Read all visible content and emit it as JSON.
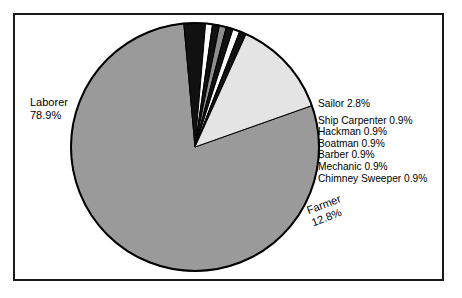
{
  "chart_data": {
    "type": "pie",
    "title": "",
    "subtitle": "",
    "xlabel": "",
    "ylabel": "",
    "legend_position": "callout-labels",
    "grid": false,
    "start_angle_deg": -19.5,
    "direction": "clockwise",
    "categories": [
      "Laborer",
      "Sailor",
      "Ship Carpenter",
      "Hackman",
      "Boatman",
      "Barber",
      "Mechanic",
      "Chimney Sweeper",
      "Farmer"
    ],
    "values": [
      78.9,
      2.8,
      0.9,
      0.9,
      0.9,
      0.9,
      0.9,
      0.9,
      12.8
    ],
    "unit": "%",
    "slices": [
      {
        "label": "Laborer",
        "value": 78.9,
        "display": "78.9%",
        "color": "#9a9a9a",
        "label_position": "outside-left"
      },
      {
        "label": "Sailor",
        "value": 2.8,
        "display": "2.8%",
        "color": "#111111",
        "label_position": "outside-right"
      },
      {
        "label": "Ship Carpenter",
        "value": 0.9,
        "display": "0.9%",
        "color": "#ffffff",
        "label_position": "outside-right"
      },
      {
        "label": "Hackman",
        "value": 0.9,
        "display": "0.9%",
        "color": "#111111",
        "label_position": "outside-right"
      },
      {
        "label": "Boatman",
        "value": 0.9,
        "display": "0.9%",
        "color": "#8e8e8e",
        "label_position": "outside-right"
      },
      {
        "label": "Barber",
        "value": 0.9,
        "display": "0.9%",
        "color": "#111111",
        "label_position": "outside-right"
      },
      {
        "label": "Mechanic",
        "value": 0.9,
        "display": "0.9%",
        "color": "#ffffff",
        "label_position": "outside-right"
      },
      {
        "label": "Chimney Sweeper",
        "value": 0.9,
        "display": "0.9%",
        "color": "#111111",
        "label_position": "outside-right"
      },
      {
        "label": "Farmer",
        "value": 12.8,
        "display": "12.8%",
        "color": "#e4e4e4",
        "label_position": "outside-right-rotated"
      }
    ]
  },
  "labels": {
    "laborer_name": "Laborer",
    "laborer_value": "78.9%",
    "farmer_name": "Farmer",
    "farmer_value": "12.8%",
    "sailor": "Sailor 2.8%",
    "ship_carpenter": "Ship Carpenter 0.9%",
    "hackman": "Hackman 0.9%",
    "boatman": "Boatman 0.9%",
    "barber": "Barber 0.9%",
    "mechanic": "Mechanic 0.9%",
    "chimney_sweeper": "Chimney Sweeper 0.9%"
  },
  "colors": {
    "frame": "#1a1a1a",
    "background": "#ffffff",
    "outline": "#000000",
    "laborer": "#9a9a9a",
    "farmer": "#e4e4e4",
    "dark": "#111111",
    "mid_gray": "#8e8e8e",
    "white": "#ffffff"
  }
}
